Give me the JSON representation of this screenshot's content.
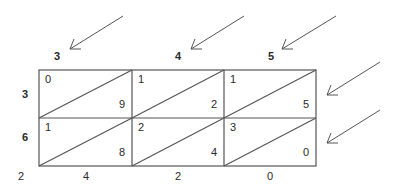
{
  "diagram": {
    "multiplicand_digits": [
      "3",
      "4",
      "5"
    ],
    "multiplier_digits": [
      "3",
      "6"
    ],
    "cells": [
      [
        {
          "tens": "0",
          "ones": "9"
        },
        {
          "tens": "1",
          "ones": "2"
        },
        {
          "tens": "1",
          "ones": "5"
        }
      ],
      [
        {
          "tens": "1",
          "ones": "8"
        },
        {
          "tens": "2",
          "ones": "4"
        },
        {
          "tens": "3",
          "ones": "0"
        }
      ]
    ],
    "result_digits": [
      "2",
      "4",
      "2",
      "0"
    ],
    "colors": {
      "line": "#555555",
      "text": "#2a2a2a",
      "background": "#ffffff"
    }
  }
}
